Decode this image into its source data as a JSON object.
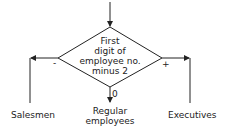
{
  "diagram": {
    "type": "flowchart-decision",
    "decision": {
      "lines": [
        "First",
        "digit of",
        "employee no.",
        "minus 2"
      ]
    },
    "branches": {
      "negative": {
        "sign": "-",
        "target": "Salesmen"
      },
      "zero": {
        "sign": "0",
        "target_lines": [
          "Regular",
          "employees"
        ]
      },
      "positive": {
        "sign": "+",
        "target": "Executives"
      }
    },
    "stroke_color": "#222222"
  }
}
